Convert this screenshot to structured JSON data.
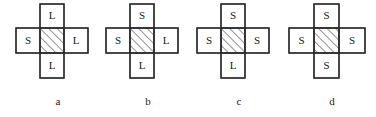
{
  "figure": {
    "background_color": "#ffffff",
    "stroke_color": "#2b2b2b",
    "text_color": "#1a1a1a",
    "hatch_color": "#4a4a4a",
    "hatch_direction": "forward-slash-45deg",
    "panels": [
      {
        "caption": "a",
        "cells": {
          "top": "L",
          "left": "S",
          "center": "",
          "right": "L",
          "bottom": "L"
        }
      },
      {
        "caption": "b",
        "cells": {
          "top": "S",
          "left": "S",
          "center": "",
          "right": "L",
          "bottom": "L"
        }
      },
      {
        "caption": "c",
        "cells": {
          "top": "S",
          "left": "S",
          "center": "",
          "right": "S",
          "bottom": "L"
        }
      },
      {
        "caption": "d",
        "cells": {
          "top": "S",
          "left": "S",
          "center": "",
          "right": "S",
          "bottom": "S"
        }
      }
    ]
  }
}
